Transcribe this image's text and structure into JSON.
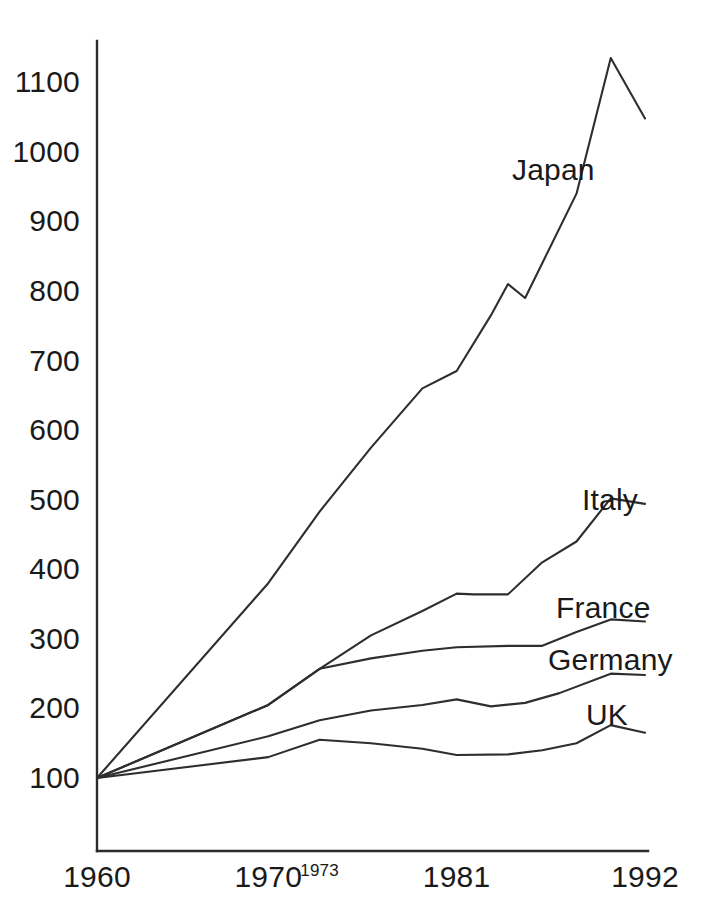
{
  "chart_data": {
    "type": "line",
    "title": "",
    "subtitle": "",
    "xlabel": "",
    "ylabel": "",
    "xlim": [
      1960,
      1992
    ],
    "ylim": [
      100,
      1150
    ],
    "grid": false,
    "legend_position": "inline-right-of-line-ends",
    "y_ticks": [
      100,
      200,
      300,
      400,
      500,
      600,
      700,
      800,
      900,
      1000,
      1100
    ],
    "x_ticks": [
      1960,
      1970,
      1973,
      1981,
      1992
    ],
    "x_tick_labels": [
      "1960",
      "1970",
      "1973",
      "1981",
      "1992"
    ],
    "y_tick_labels": [
      "100",
      "200",
      "300",
      "400",
      "500",
      "600",
      "700",
      "800",
      "900",
      "1000",
      "1100"
    ],
    "series": [
      {
        "name": "Japan",
        "label": "Japan",
        "x": [
          1960,
          1970,
          1973,
          1976,
          1979,
          1981,
          1983,
          1984,
          1985,
          1988,
          1990,
          1992
        ],
        "values": [
          100,
          380,
          483,
          575,
          660,
          685,
          765,
          810,
          790,
          940,
          1135,
          1048
        ]
      },
      {
        "name": "Italy",
        "label": "Italy",
        "x": [
          1960,
          1970,
          1973,
          1976,
          1979,
          1981,
          1982,
          1984,
          1986,
          1988,
          1990,
          1992
        ],
        "values": [
          100,
          205,
          257,
          305,
          340,
          365,
          364,
          364,
          410,
          440,
          502,
          494
        ]
      },
      {
        "name": "France",
        "label": "France",
        "x": [
          1960,
          1970,
          1973,
          1976,
          1979,
          1981,
          1984,
          1986,
          1988,
          1990,
          1992
        ],
        "values": [
          100,
          205,
          257,
          272,
          283,
          288,
          290,
          290,
          310,
          328,
          325
        ]
      },
      {
        "name": "Germany",
        "label": "Germany",
        "x": [
          1960,
          1970,
          1973,
          1976,
          1979,
          1981,
          1983,
          1985,
          1987,
          1990,
          1992
        ],
        "values": [
          100,
          160,
          183,
          197,
          205,
          213,
          203,
          208,
          222,
          250,
          248
        ]
      },
      {
        "name": "UK",
        "label": "UK",
        "x": [
          1960,
          1970,
          1973,
          1976,
          1979,
          1981,
          1984,
          1986,
          1988,
          1990,
          1992
        ],
        "values": [
          100,
          130,
          155,
          150,
          142,
          133,
          134,
          140,
          150,
          176,
          165
        ]
      }
    ],
    "annotations": []
  },
  "axis": {
    "y_labels": [
      {
        "text": "1100",
        "value": 1100
      },
      {
        "text": "1000",
        "value": 1000
      },
      {
        "text": "900",
        "value": 900
      },
      {
        "text": "800",
        "value": 800
      },
      {
        "text": "700",
        "value": 700
      },
      {
        "text": "600",
        "value": 600
      },
      {
        "text": "500",
        "value": 500
      },
      {
        "text": "400",
        "value": 400
      },
      {
        "text": "300",
        "value": 300
      },
      {
        "text": "200",
        "value": 200
      },
      {
        "text": "100",
        "value": 100
      }
    ],
    "x_labels": [
      {
        "text": "1960",
        "value": 1960,
        "small": false
      },
      {
        "text": "1970",
        "value": 1970,
        "small": false
      },
      {
        "text": "1973",
        "value": 1973,
        "small": true
      },
      {
        "text": "1981",
        "value": 1981,
        "small": false
      },
      {
        "text": "1992",
        "value": 1992,
        "small": false
      }
    ]
  },
  "series_labels": [
    {
      "text": "Japan",
      "name": "japan"
    },
    {
      "text": "Italy",
      "name": "italy"
    },
    {
      "text": "France",
      "name": "france"
    },
    {
      "text": "Germany",
      "name": "germany"
    },
    {
      "text": "UK",
      "name": "uk"
    }
  ],
  "colors": {
    "background": "#ffffff",
    "line": "#2e2e2e",
    "axis": "#2b2b2b",
    "text": "#1a1a1a"
  }
}
